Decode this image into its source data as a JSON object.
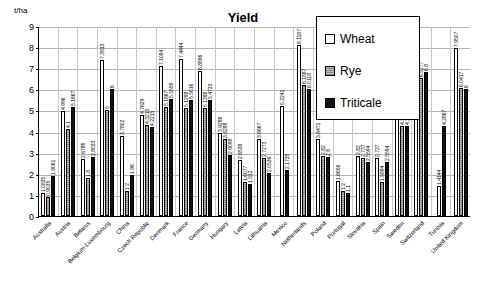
{
  "chart_data": {
    "type": "bar",
    "title": "Yield",
    "unit_label": "t/ha",
    "xlabel": "",
    "ylabel": "t/ha",
    "ylim": [
      0,
      9
    ],
    "yticks": [
      0,
      1,
      2,
      3,
      4,
      5,
      6,
      7,
      8,
      9
    ],
    "grid": true,
    "legend_position": "top-right",
    "categories": [
      "Australia",
      "Austria",
      "Belarus",
      "Belgium-Luxembourg",
      "China",
      "Czech Republic",
      "Denmark",
      "France",
      "Germany",
      "Hungary",
      "Latvia",
      "Lithuania",
      "Mexico",
      "Netherlands",
      "Poland",
      "Portugal",
      "Slovakia",
      "Spain",
      "Sweden",
      "Switzerland",
      "Tunisia",
      "United Kingdom"
    ],
    "series": [
      {
        "name": "Wheat",
        "color": "#ffffff",
        "values": [
          1.0835,
          4.996,
          2.6786,
          7.3913,
          3.7802,
          4.7629,
          7.1084,
          7.4444,
          6.8896,
          3.9298,
          2.6538,
          3.6667,
          5.2241,
          8.1187,
          3.6471,
          1.6656,
          2.82,
          2.737,
          6.3569,
          6.3777,
          1.4144,
          7.9507
        ],
        "labels": [
          "1.0835",
          "4.996",
          "2.6786",
          "7.3913",
          "3.7802",
          "4.7629",
          "7.1084",
          "7.4444",
          "6.8896",
          "3.9298",
          "2.6538",
          "3.6667",
          "5.2241",
          "8.1187",
          "3.6471",
          "1.6656",
          "2.82",
          "2.737",
          "6.3569",
          "6.3777",
          "1.4144",
          "7.9507"
        ]
      },
      {
        "name": "Rye",
        "color": "#9c9c9c",
        "values": [
          0.9035,
          4.1,
          1.8,
          5.0,
          1.2,
          4.3215,
          5.1867,
          5.1298,
          5.1398,
          3.6298,
          1.6077,
          2.7273,
          0,
          6.1887,
          2.82,
          1.2,
          2.737,
          1.5894,
          4.25,
          6.5277,
          0,
          6.0417
        ],
        "labels": [
          "0.9035",
          "4.1",
          "1.8",
          "5",
          "1.2",
          "4.3215",
          "5.1867",
          "5.1298",
          "5.1398",
          "3.6298",
          "1.6077",
          "2.7273",
          "",
          "6.1887",
          "2.82",
          "1.2",
          "2.737",
          "1.5894",
          "4.25",
          "6.5277",
          "",
          "6.0417"
        ]
      },
      {
        "name": "Triticale",
        "color": "#111111",
        "values": [
          1.9061,
          5.1667,
          2.8033,
          6.0,
          1.96,
          4.2215,
          5.5556,
          5.5016,
          5.4733,
          2.9098,
          1.512,
          2.0536,
          2.1735,
          6.0118,
          2.8,
          1.1,
          2.5594,
          2.5594,
          4.25,
          6.8,
          4.2867,
          6.0
        ],
        "labels": [
          "1.9061",
          "5.1667",
          "2.8033",
          "6",
          "1.96",
          "4.2215",
          "5.5556",
          "5.5016",
          "5.4733",
          "2.9098",
          "1.512",
          "2.0536",
          "2.1735",
          "6.0118",
          "2.8",
          "1.1",
          "2.5594",
          "2.5594",
          "4.25",
          "6.8",
          "4.2867",
          "6"
        ]
      }
    ]
  }
}
